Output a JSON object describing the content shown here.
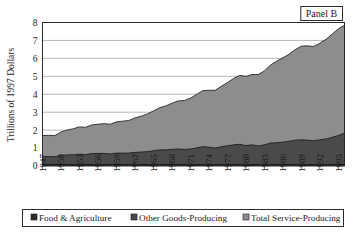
{
  "panel": {
    "label": "Panel B"
  },
  "axes": {
    "ylabel": "Trillions of 1997 Dollars",
    "xlabel": "",
    "y_ticks": [
      "0",
      "1",
      "2",
      "3",
      "4",
      "5",
      "6",
      "7",
      "8"
    ],
    "x_ticks": [
      "1947",
      "1950",
      "1953",
      "1956",
      "1959",
      "1962",
      "1965",
      "1968",
      "1971",
      "1974",
      "1977",
      "1980",
      "1983",
      "1986",
      "1989",
      "1992",
      "1995"
    ]
  },
  "legend": {
    "items": [
      {
        "label": "Food & Agriculture",
        "color": "#2e2e2e"
      },
      {
        "label": "Other Goods-Producing",
        "color": "#4a4a4a"
      },
      {
        "label": "Total Service-Producing",
        "color": "#8d8d8d"
      }
    ]
  },
  "chart_data": {
    "type": "area",
    "stacked": true,
    "title": "Panel B",
    "xlabel": "",
    "ylabel": "Trillions of 1997 Dollars",
    "ylim": [
      0,
      8
    ],
    "xlim": [
      1947,
      1996
    ],
    "grid": true,
    "legend_position": "bottom",
    "x": [
      1947,
      1948,
      1949,
      1950,
      1951,
      1952,
      1953,
      1954,
      1955,
      1956,
      1957,
      1958,
      1959,
      1960,
      1961,
      1962,
      1963,
      1964,
      1965,
      1966,
      1967,
      1968,
      1969,
      1970,
      1971,
      1972,
      1973,
      1974,
      1975,
      1976,
      1977,
      1978,
      1979,
      1980,
      1981,
      1982,
      1983,
      1984,
      1985,
      1986,
      1987,
      1988,
      1989,
      1990,
      1991,
      1992,
      1993,
      1994,
      1995,
      1996
    ],
    "series": [
      {
        "name": "Food & Agriculture",
        "color": "#2e2e2e",
        "values": [
          0.08,
          0.08,
          0.08,
          0.08,
          0.08,
          0.08,
          0.08,
          0.08,
          0.08,
          0.08,
          0.08,
          0.08,
          0.08,
          0.08,
          0.08,
          0.08,
          0.08,
          0.08,
          0.08,
          0.08,
          0.08,
          0.08,
          0.08,
          0.08,
          0.08,
          0.08,
          0.08,
          0.08,
          0.08,
          0.08,
          0.08,
          0.08,
          0.08,
          0.08,
          0.08,
          0.08,
          0.08,
          0.08,
          0.08,
          0.08,
          0.08,
          0.08,
          0.08,
          0.08,
          0.08,
          0.08,
          0.08,
          0.08,
          0.08,
          0.08
        ]
      },
      {
        "name": "Other Goods-Producing",
        "color": "#4a4a4a",
        "values": [
          0.44,
          0.45,
          0.44,
          0.5,
          0.54,
          0.55,
          0.58,
          0.56,
          0.61,
          0.62,
          0.62,
          0.59,
          0.64,
          0.64,
          0.64,
          0.68,
          0.7,
          0.72,
          0.77,
          0.82,
          0.82,
          0.85,
          0.87,
          0.84,
          0.87,
          0.93,
          1.0,
          0.97,
          0.92,
          0.99,
          1.05,
          1.1,
          1.13,
          1.06,
          1.1,
          1.04,
          1.1,
          1.2,
          1.22,
          1.25,
          1.3,
          1.36,
          1.38,
          1.36,
          1.33,
          1.38,
          1.43,
          1.52,
          1.62,
          1.75
        ]
      },
      {
        "name": "Total Service-Producing",
        "color": "#8d8d8d",
        "values": [
          1.18,
          1.18,
          1.18,
          1.32,
          1.38,
          1.45,
          1.52,
          1.52,
          1.6,
          1.63,
          1.66,
          1.66,
          1.74,
          1.78,
          1.82,
          1.92,
          2.0,
          2.1,
          2.22,
          2.35,
          2.45,
          2.57,
          2.68,
          2.73,
          2.83,
          2.98,
          3.12,
          3.17,
          3.22,
          3.37,
          3.52,
          3.7,
          3.84,
          3.86,
          3.92,
          3.98,
          4.12,
          4.35,
          4.55,
          4.7,
          4.85,
          5.05,
          5.22,
          5.26,
          5.25,
          5.39,
          5.55,
          5.75,
          5.95,
          6.02
        ]
      }
    ]
  }
}
